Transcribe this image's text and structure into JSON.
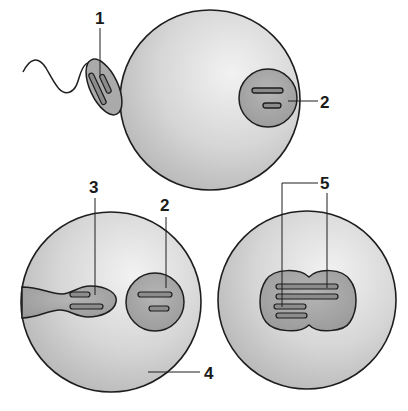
{
  "diagram": {
    "type": "fertilization-stages",
    "colors": {
      "egg_fill_light": "#ececec",
      "egg_fill_dark": "#b9b9b9",
      "nucleus_fill": "#a6a6a6",
      "outline": "#1e1e1e",
      "chromosome_fill": "#8c8c8c"
    },
    "labels": {
      "l1": "1",
      "l2_top": "2",
      "l2_bottom": "2",
      "l3": "3",
      "l4": "4",
      "l5": "5"
    },
    "panels": [
      {
        "id": "sperm-contact",
        "elements": [
          "sperm",
          "egg",
          "egg-nucleus"
        ]
      },
      {
        "id": "pronuclei",
        "elements": [
          "egg",
          "male-pronucleus",
          "female-pronucleus"
        ]
      },
      {
        "id": "zygote-fusion",
        "elements": [
          "egg",
          "fused-nucleus"
        ]
      }
    ]
  }
}
